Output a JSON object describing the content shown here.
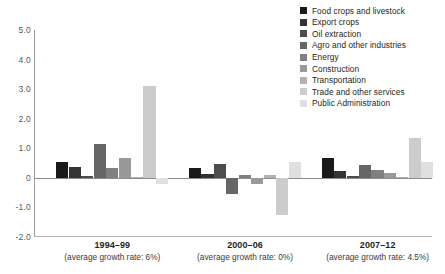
{
  "chart_data": {
    "type": "bar",
    "title": "",
    "subtitle": "",
    "xlabel": "",
    "ylabel": "",
    "ylim": [
      -2.0,
      5.0
    ],
    "yticks": [
      5.0,
      4.0,
      3.0,
      2.0,
      1.0,
      0,
      -1.0,
      -2.0
    ],
    "ytick_labels": [
      "5.0",
      "4.0",
      "3.0",
      "2.0",
      "1.0",
      "0",
      "-1.0",
      "-2.0"
    ],
    "grid": false,
    "legend_position": "top-right",
    "categories": [
      "1994–99",
      "2000–06",
      "2007–12"
    ],
    "category_sublabels": [
      "(average growth rate: 6%)",
      "(average growth rate: 0%)",
      "(average growth rate: 4.5%)"
    ],
    "series": [
      {
        "name": "Food crops and livestock",
        "color": "#1a1a1a",
        "values": [
          0.55,
          0.33,
          0.67
        ]
      },
      {
        "name": "Export crops",
        "color": "#333333",
        "values": [
          0.37,
          0.13,
          0.23
        ]
      },
      {
        "name": "Oil extraction",
        "color": "#4d4d4d",
        "values": [
          0.07,
          0.47,
          0.05
        ]
      },
      {
        "name": "Agro and other industries",
        "color": "#666666",
        "values": [
          1.15,
          -0.55,
          0.42
        ]
      },
      {
        "name": "Energy",
        "color": "#808080",
        "values": [
          0.35,
          0.08,
          0.28
        ]
      },
      {
        "name": "Construction",
        "color": "#999999",
        "values": [
          0.68,
          -0.2,
          0.15
        ]
      },
      {
        "name": "Transportation",
        "color": "#b3b3b3",
        "values": [
          0.02,
          0.08,
          0.03
        ]
      },
      {
        "name": "Trade and other services",
        "color": "#cccccc",
        "values": [
          3.1,
          -1.25,
          1.35
        ]
      },
      {
        "name": "Public Administration",
        "color": "#e0e0e0",
        "values": [
          -0.2,
          0.52,
          0.52
        ]
      }
    ]
  },
  "legend": {
    "items": [
      {
        "label": "Food crops and livestock"
      },
      {
        "label": "Export crops"
      },
      {
        "label": "Oil extraction"
      },
      {
        "label": "Agro and other industries"
      },
      {
        "label": "Energy"
      },
      {
        "label": "Construction"
      },
      {
        "label": "Transportation"
      },
      {
        "label": "Trade and other services"
      },
      {
        "label": "Public Administration"
      }
    ]
  },
  "colors": {
    "axis": "#9a9a9a",
    "zero_line": "#8c8c8c",
    "tick_text": "#58595b",
    "label_text": "#231f20",
    "background": "#ffffff"
  }
}
